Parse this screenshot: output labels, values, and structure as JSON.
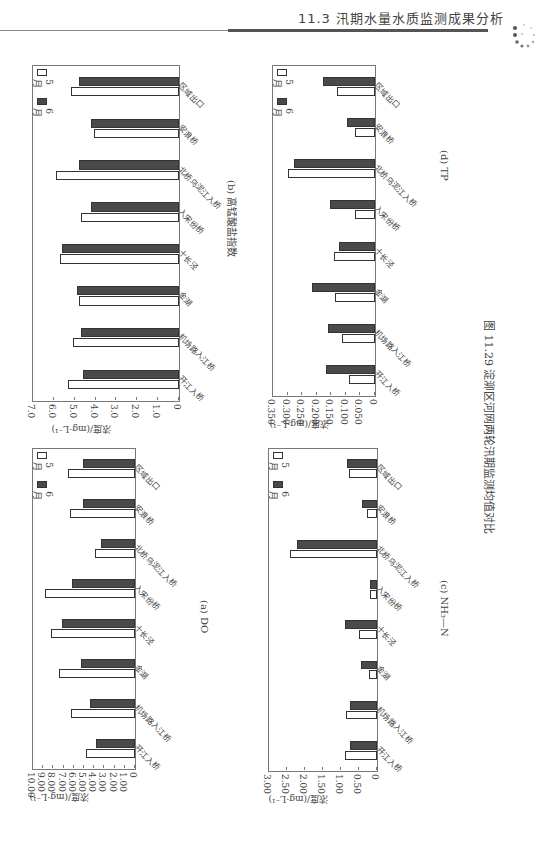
{
  "header": {
    "section": "11.3   汛期水量水质监测成果分析"
  },
  "figure_caption": "图 11.29   淀泖区河网两轮汛期监测均值对比",
  "legend": {
    "may": "5 月",
    "june": "6 月"
  },
  "ylabel": "浓度/(mg · L⁻¹)",
  "categories": [
    "开江入桥",
    "机场路入江桥",
    "金湖",
    "十长泾",
    "入宋份桥",
    "北桥乌泥江入桥",
    "安浪桥",
    "区域出口"
  ],
  "chart_data": [
    {
      "id": "a",
      "type": "bar",
      "title": "(a) DO",
      "ylabel": "浓度/(mg·L⁻¹)",
      "ylim": [
        0,
        10
      ],
      "yticks": [
        "0",
        "1.00",
        "2.00",
        "3.00",
        "4.00",
        "5.00",
        "6.00",
        "7.00",
        "8.00",
        "9.00",
        "10.00"
      ],
      "categories": [
        "开江入桥",
        "机场路入江桥",
        "金湖",
        "十长泾",
        "入宋份桥",
        "北桥乌泥江入桥",
        "安浪桥",
        "区域出口"
      ],
      "series": [
        {
          "name": "5 月",
          "values": [
            4.8,
            6.3,
            7.5,
            8.2,
            8.8,
            3.9,
            6.4,
            6.6
          ]
        },
        {
          "name": "6 月",
          "values": [
            3.8,
            4.4,
            5.3,
            7.2,
            6.2,
            3.3,
            5.1,
            5.1
          ]
        }
      ]
    },
    {
      "id": "b",
      "type": "bar",
      "title": "(b) 高锰酸盐指数",
      "ylabel": "浓度/(mg·L⁻¹)",
      "ylim": [
        0,
        7
      ],
      "yticks": [
        "0",
        "1.0",
        "2.0",
        "3.0",
        "4.0",
        "5.0",
        "6.0",
        "7.0"
      ],
      "categories": [
        "开江入桥",
        "机场路入江桥",
        "金湖",
        "十长泾",
        "入宋份桥",
        "北桥乌泥江入桥",
        "安浪桥",
        "区域出口"
      ],
      "series": [
        {
          "name": "5 月",
          "values": [
            5.3,
            5.1,
            4.8,
            5.7,
            4.7,
            5.9,
            4.1,
            5.2
          ]
        },
        {
          "name": "6 月",
          "values": [
            4.6,
            4.7,
            4.9,
            5.6,
            4.2,
            4.8,
            4.2,
            4.8
          ]
        }
      ]
    },
    {
      "id": "c",
      "type": "bar",
      "title": "(c) NH₃—N",
      "ylabel": "浓度/(mg·L⁻¹)",
      "ylim": [
        0,
        3
      ],
      "yticks": [
        "0",
        "0.50",
        "1.00",
        "1.50",
        "2.00",
        "2.50",
        "3.00"
      ],
      "categories": [
        "开江入桥",
        "机场路入江桥",
        "金湖",
        "十长泾",
        "入宋份桥",
        "北桥乌泥江入桥",
        "安浪桥",
        "区域出口"
      ],
      "series": [
        {
          "name": "5 月",
          "values": [
            0.89,
            0.87,
            0.23,
            0.5,
            0.19,
            2.42,
            0.27,
            0.78
          ]
        },
        {
          "name": "6 月",
          "values": [
            0.74,
            0.74,
            0.45,
            0.88,
            0.19,
            2.21,
            0.41,
            0.82
          ]
        }
      ]
    },
    {
      "id": "d",
      "type": "bar",
      "title": "(d) TP",
      "ylabel": "浓度/(mg·L⁻¹)",
      "ylim": [
        0,
        0.35
      ],
      "yticks": [
        "0",
        "0.050",
        "0.100",
        "0.150",
        "0.200",
        "0.250",
        "0.300",
        "0.350"
      ],
      "categories": [
        "开江入桥",
        "机场路入江桥",
        "金湖",
        "十长泾",
        "入宋份桥",
        "北桥乌泥江入桥",
        "安浪桥",
        "区域出口"
      ],
      "series": [
        {
          "name": "5 月",
          "values": [
            0.088,
            0.115,
            0.138,
            0.142,
            0.07,
            0.298,
            0.068,
            0.132
          ]
        },
        {
          "name": "6 月",
          "values": [
            0.168,
            0.163,
            0.215,
            0.124,
            0.155,
            0.278,
            0.097,
            0.177
          ]
        }
      ]
    }
  ]
}
